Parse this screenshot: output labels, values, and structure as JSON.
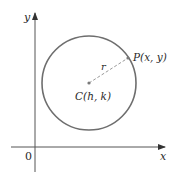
{
  "diagram": {
    "axes": {
      "x_label": "x",
      "y_label": "y",
      "origin_label": "0"
    },
    "circle": {
      "center_label": "C(h, k)",
      "point_label": "P(x, y)",
      "radius_label": "r",
      "stroke_color": "#6e6e6e"
    },
    "colors": {
      "axis": "#555555",
      "dashed_radius": "#9a9a9a",
      "dot": "#7a7a7a"
    }
  }
}
